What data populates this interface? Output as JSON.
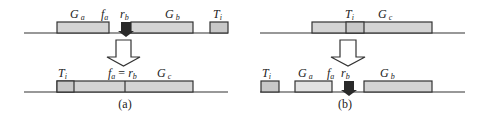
{
  "colors": {
    "line": "#333333",
    "box_fill": "#d4d4d4",
    "tail_fill": "#c8c8c8",
    "dark_arrow": "#2a2a2a",
    "hollow_arrow": "#ffffff"
  },
  "panel_a": {
    "caption": "(a)",
    "before": {
      "labels": {
        "ga": {
          "main": "G",
          "sub": "a"
        },
        "fa": {
          "main": "f",
          "sub": "a"
        },
        "rb": {
          "main": "r",
          "sub": "b"
        },
        "gb": {
          "main": "G",
          "sub": "b"
        },
        "ti": {
          "main": "T",
          "sub": "i"
        }
      }
    },
    "after": {
      "labels": {
        "ti": {
          "main": "T",
          "sub": "i"
        },
        "eq": {
          "f": "f",
          "fs": "a",
          "eq": " = ",
          "r": "r",
          "rs": "b"
        },
        "gc": {
          "main": "G",
          "sub": "c"
        }
      }
    }
  },
  "panel_b": {
    "caption": "(b)",
    "before": {
      "labels": {
        "ti": {
          "main": "T",
          "sub": "i"
        },
        "gc": {
          "main": "G",
          "sub": "c"
        }
      }
    },
    "after": {
      "labels": {
        "ti": {
          "main": "T",
          "sub": "i"
        },
        "ga": {
          "main": "G",
          "sub": "a"
        },
        "fa": {
          "main": "f",
          "sub": "a"
        },
        "rb": {
          "main": "r",
          "sub": "b"
        },
        "gb": {
          "main": "G",
          "sub": "b"
        }
      }
    }
  }
}
